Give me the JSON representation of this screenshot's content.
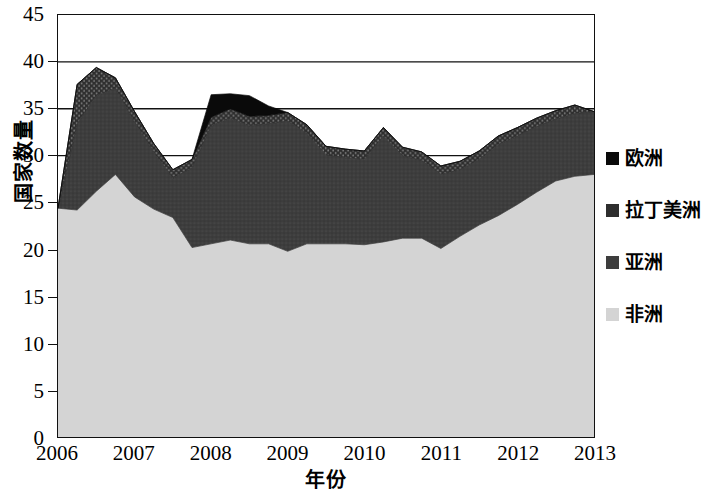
{
  "chart_data": {
    "type": "area",
    "stacked": true,
    "title": "",
    "xlabel": "年份",
    "ylabel": "国家数量",
    "xlim": [
      2006,
      2013
    ],
    "ylim": [
      0,
      45
    ],
    "grid": true,
    "gridlines_y": [
      30,
      35,
      40
    ],
    "legend_position": "right",
    "x_tick_labels": [
      "2006",
      "2007",
      "2008",
      "2009",
      "2010",
      "2011",
      "2012",
      "2013"
    ],
    "x_ticks": [
      2006,
      2007,
      2008,
      2009,
      2010,
      2011,
      2012,
      2013
    ],
    "y_tick_labels": [
      "0",
      "5",
      "10",
      "15",
      "20",
      "25",
      "30",
      "35",
      "40",
      "45"
    ],
    "y_ticks": [
      0,
      5,
      10,
      15,
      20,
      25,
      30,
      35,
      40,
      45
    ],
    "x": [
      2006.0,
      2006.25,
      2006.5,
      2006.75,
      2007.0,
      2007.25,
      2007.5,
      2007.75,
      2008.0,
      2008.25,
      2008.5,
      2008.75,
      2009.0,
      2009.25,
      2009.5,
      2009.75,
      2010.0,
      2010.25,
      2010.5,
      2010.75,
      2011.0,
      2011.25,
      2011.5,
      2011.75,
      2012.0,
      2012.25,
      2012.5,
      2012.75,
      2013.0
    ],
    "series": [
      {
        "name": "非洲",
        "color": "#d4d4d4",
        "order": 1,
        "values": [
          24.4,
          24.2,
          26.2,
          28.0,
          25.6,
          24.3,
          23.4,
          20.2,
          20.6,
          21.0,
          20.6,
          20.6,
          19.8,
          20.6,
          20.6,
          20.6,
          20.5,
          20.8,
          21.2,
          21.2,
          20.1,
          21.4,
          22.6,
          23.6,
          24.8,
          26.1,
          27.3,
          27.8,
          28.0
        ]
      },
      {
        "name": "亚洲",
        "color": "#3d3d3d",
        "order": 2,
        "values": [
          0.0,
          9.2,
          10.2,
          9.2,
          8.0,
          6.1,
          4.2,
          8.5,
          12.6,
          13.0,
          12.6,
          12.8,
          13.9,
          11.8,
          9.5,
          9.2,
          9.1,
          11.3,
          8.8,
          8.3,
          7.9,
          7.1,
          7.0,
          7.6,
          7.3,
          7.0,
          6.6,
          6.7,
          6.7
        ]
      },
      {
        "name": "拉丁美洲",
        "color": "#2e2e2e",
        "order": 3,
        "values": [
          0.0,
          4.2,
          3.0,
          1.1,
          1.1,
          0.9,
          0.9,
          0.9,
          0.9,
          1.0,
          1.0,
          0.9,
          0.9,
          0.9,
          0.9,
          0.9,
          0.9,
          0.9,
          0.9,
          0.9,
          0.9,
          0.9,
          0.9,
          0.9,
          0.9,
          0.9,
          0.9,
          0.9,
          0.0
        ]
      },
      {
        "name": "欧洲",
        "color": "#0a0a0a",
        "order": 4,
        "values": [
          0.0,
          0.0,
          0.0,
          0.0,
          0.0,
          0.0,
          0.0,
          0.0,
          2.4,
          1.6,
          2.2,
          1.0,
          0.0,
          0.0,
          0.0,
          0.0,
          0.0,
          0.0,
          0.0,
          0.0,
          0.0,
          0.0,
          0.0,
          0.0,
          0.0,
          0.0,
          0.0,
          0.0,
          0.0
        ]
      }
    ],
    "totals": [
      24.4,
      37.6,
      39.4,
      38.3,
      34.7,
      31.3,
      28.5,
      30.6,
      36.5,
      36.6,
      36.4,
      35.3,
      34.6,
      33.3,
      31.0,
      30.7,
      30.5,
      33.0,
      30.9,
      30.4,
      28.9,
      29.4,
      30.5,
      32.1,
      33.0,
      34.0,
      34.8,
      35.4,
      34.7
    ]
  },
  "legend": {
    "entries": [
      {
        "label": "欧洲",
        "color": "#0a0a0a"
      },
      {
        "label": "拉丁美洲",
        "color": "#2e2e2e"
      },
      {
        "label": "亚洲",
        "color": "#3d3d3d"
      },
      {
        "label": "非洲",
        "color": "#d4d4d4"
      }
    ]
  },
  "axes": {
    "y_title": "国家数量",
    "x_title": "年份"
  }
}
